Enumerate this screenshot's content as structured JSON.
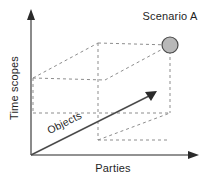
{
  "figure": {
    "background_color": "#ffffff",
    "axis_color": "#6e6e6e",
    "cube_edge_color": "#8d8d8d",
    "marker_fill_color": "#b8b8b8",
    "marker_stroke_color": "#4a4a4a",
    "text_color": "#1f1f1f"
  },
  "axes": {
    "vertical": {
      "label": "Time scopes",
      "orientation": "vertical-up",
      "arrow": "arrow-up"
    },
    "horizontal": {
      "label": "Parties",
      "orientation": "horizontal-right",
      "arrow": "arrow-right"
    },
    "depth": {
      "label": "Objects",
      "orientation": "diagonal-up-right",
      "arrow": "arrow-diagonal"
    }
  },
  "markers": [
    {
      "label": "Scenario A",
      "shape": "filled-circle",
      "cx": 170,
      "cy": 45,
      "r": 8
    }
  ],
  "geometry": {
    "origin": {
      "x": 31,
      "y": 155
    },
    "vertical_axis_tip": {
      "x": 31,
      "y": 12
    },
    "horizontal_axis_tip": {
      "x": 197,
      "y": 155
    },
    "depth_vector_tip": {
      "x": 155,
      "y": 93
    },
    "cube_vertices": {
      "front_bottom_left": {
        "x": 98,
        "y": 140
      },
      "front_bottom_right": {
        "x": 170,
        "y": 113
      },
      "front_top_left": {
        "x": 98,
        "y": 43
      },
      "front_top_right": {
        "x": 170,
        "y": 45
      },
      "back_bottom_left": {
        "x": 33,
        "y": 113
      },
      "back_top_left": {
        "x": 33,
        "y": 78
      },
      "back_top_mid": {
        "x": 98,
        "y": 43
      }
    }
  }
}
